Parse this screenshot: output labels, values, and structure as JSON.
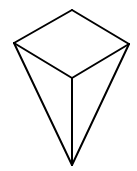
{
  "diagram": {
    "type": "polyhedron-line-drawing",
    "stroke_color": "#000000",
    "background": "#ffffff",
    "vertices": {
      "top": [
        72,
        10
      ],
      "left": [
        14,
        43
      ],
      "right": [
        129,
        44
      ],
      "center": [
        72,
        78
      ],
      "bottom": [
        72,
        165
      ]
    },
    "edges": [
      [
        "top",
        "left"
      ],
      [
        "top",
        "right"
      ],
      [
        "left",
        "center"
      ],
      [
        "right",
        "center"
      ],
      [
        "center",
        "bottom"
      ],
      [
        "left",
        "bottom"
      ],
      [
        "right",
        "bottom"
      ]
    ]
  }
}
